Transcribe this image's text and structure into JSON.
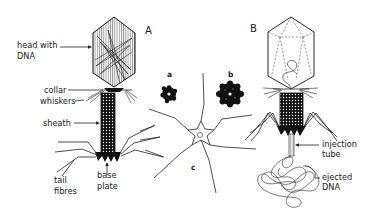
{
  "figure": {
    "panels": {
      "A": "A",
      "B": "B",
      "a": "a",
      "b": "b",
      "c": "c"
    },
    "labels_A": {
      "head_line1": "head with",
      "head_line2": "DNA",
      "collar": "collar",
      "whiskers": "whiskers",
      "sheath": "sheath",
      "tail_line1": "tail",
      "tail_line2": "fibres",
      "base_line1": "base",
      "base_line2": "plate"
    },
    "labels_B": {
      "injection_line1": "injection",
      "injection_line2": "tube",
      "ejected_line1": "ejected",
      "ejected_line2": "DNA"
    },
    "colors": {
      "ink": "#222222",
      "background": "#ffffff"
    }
  }
}
